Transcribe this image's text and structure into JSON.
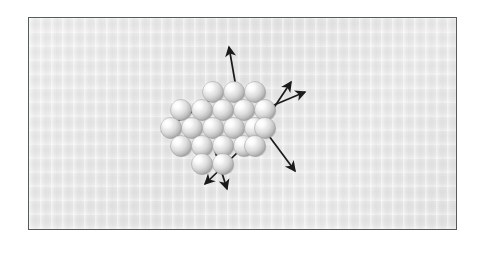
{
  "figure": {
    "title": "Cluster of spheres with radiating arrows",
    "panel": {
      "background_color": "#eaeaea",
      "border_color": "#555a5c",
      "border_width_px": 1.4,
      "x": 28,
      "y": 17,
      "width": 429,
      "height": 213
    },
    "canvas": {
      "width": 480,
      "height": 254,
      "background_color": "#ffffff"
    }
  },
  "cluster": {
    "name": "sphere-cluster",
    "sphere_count": 19,
    "sphere_radius_px": 10.5,
    "sphere_colors": {
      "highlight": "#ffffff",
      "body": "#dcdcdc",
      "shadow": "#a8a8a8",
      "edge": "#9a9a9a"
    },
    "rows": [
      {
        "row": 1,
        "count": 3,
        "y": 74,
        "xs": [
          184,
          205,
          226
        ]
      },
      {
        "row": 2,
        "count": 5,
        "y": 92,
        "xs": [
          152,
          173,
          194,
          215,
          236
        ]
      },
      {
        "row": 3,
        "count": 5,
        "y": 110,
        "xs": [
          142,
          163,
          184,
          205,
          226
        ]
      },
      {
        "row": 4,
        "count": 4,
        "y": 128,
        "xs": [
          152,
          173,
          194,
          215
        ]
      },
      {
        "row": 5,
        "count": 2,
        "y": 146,
        "xs": [
          173,
          194
        ]
      }
    ],
    "extra_spheres": [
      {
        "x": 236,
        "y": 110
      },
      {
        "x": 226,
        "y": 128
      }
    ]
  },
  "arrows": {
    "name": "radiating-arrows",
    "color": "#1a1a1a",
    "stroke_width_px": 1.7,
    "count": 7,
    "items": [
      {
        "id": "arrow-up",
        "label": "up",
        "x1": 208,
        "y1": 75,
        "x2": 200,
        "y2": 29
      },
      {
        "id": "arrow-upper-right-outer",
        "label": "upper-right-outer",
        "x1": 228,
        "y1": 115,
        "x2": 262,
        "y2": 64
      },
      {
        "id": "arrow-upper-right-inner",
        "label": "upper-right-inner",
        "x1": 226,
        "y1": 95,
        "x2": 276,
        "y2": 74
      },
      {
        "id": "arrow-left",
        "label": "left",
        "x1": 180,
        "y1": 83,
        "x2": 133,
        "y2": 113
      },
      {
        "id": "arrow-lower-left",
        "label": "lower-left",
        "x1": 210,
        "y1": 133,
        "x2": 176,
        "y2": 166
      },
      {
        "id": "arrow-down",
        "label": "down",
        "x1": 186,
        "y1": 133,
        "x2": 198,
        "y2": 171
      },
      {
        "id": "arrow-lower-right",
        "label": "lower-right",
        "x1": 240,
        "y1": 118,
        "x2": 266,
        "y2": 153
      }
    ]
  }
}
